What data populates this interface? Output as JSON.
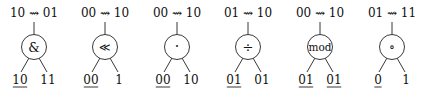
{
  "diagram": {
    "trees": [
      {
        "transition": "10 ⇝ 01",
        "operator": "&",
        "operator_name": "bitwise-and",
        "left": "10",
        "left_underlined": true,
        "right": "11",
        "right_underlined": false
      },
      {
        "transition": "00 ⇝ 10",
        "operator": "≪",
        "operator_name": "shift-left",
        "left": "00",
        "left_underlined": true,
        "right": "1",
        "right_underlined": false
      },
      {
        "transition": "00 ⇝ 10",
        "operator": "·",
        "operator_name": "multiply",
        "left": "00",
        "left_underlined": true,
        "right": "10",
        "right_underlined": false
      },
      {
        "transition": "01 ⇝ 10",
        "operator": "÷",
        "operator_name": "divide",
        "left": "01",
        "left_underlined": true,
        "right": "01",
        "right_underlined": false
      },
      {
        "transition": "00 ⇝ 10",
        "operator": "mod",
        "operator_name": "modulo",
        "left": "01",
        "left_underlined": true,
        "right": "01",
        "right_underlined": true
      },
      {
        "transition": "01 ⇝ 11",
        "operator": "∘",
        "operator_name": "compose",
        "left": "0",
        "left_underlined": true,
        "right": "1",
        "right_underlined": false
      }
    ]
  }
}
